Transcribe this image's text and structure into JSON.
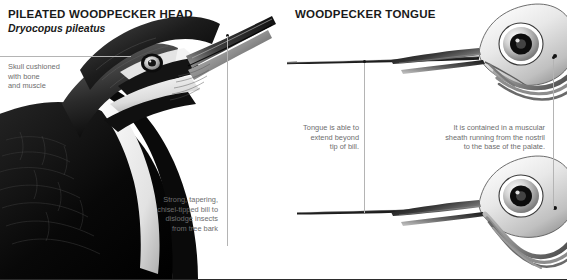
{
  "figure": {
    "background_color": "#ffffff",
    "text_color": "#1a1a1a",
    "caption_color": "#6d6d6d",
    "leader_color": "#b4b4b4"
  },
  "left_panel": {
    "title": "PILEATED WOODPECKER HEAD",
    "subtitle": "Dryocopus pileatus",
    "captions": {
      "skull": "Skull cushioned\nwith bone\nand muscle",
      "bill": "Strong, tapering,\nchisel-tipped bill to\ndislodge insects\nfrom tree bark"
    },
    "illustration": {
      "name": "pileated-woodpecker-head-photo",
      "description": "Black and white photograph of a pileated woodpecker head and upper body in profile, bill angled upward to the right, showing dark crest, white supercilium stripe, white malar stripe and black wing plumage."
    }
  },
  "right_panel": {
    "title": "WOODPECKER TONGUE",
    "captions": {
      "extend": "Tongue is able to\nextend beyond\ntip of bill.",
      "sheath": "It is contained in a muscular\nsheath running from the nostril\nto the base of the palate."
    },
    "illustrations": [
      {
        "name": "woodpecker-skull-tongue-extended",
        "description": "Grayscale anatomical drawing of a woodpecker skull in profile with the hyoid apparatus and tongue fully extended far beyond the tip of the bill."
      },
      {
        "name": "woodpecker-skull-tongue-retracted",
        "description": "Grayscale anatomical drawing of a woodpecker skull in profile with the tongue retracted, the hyoid horns curving back and over the top of the cranium."
      }
    ]
  }
}
